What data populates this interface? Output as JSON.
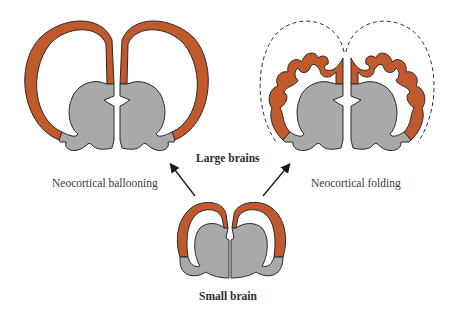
{
  "figure": {
    "labels": {
      "large_brains": "Large brains",
      "small_brain": "Small brain",
      "ballooning": "Neocortical ballooning",
      "folding": "Neocortical folding"
    },
    "nodes": [
      {
        "id": "small-brain",
        "label": "Small brain",
        "type": "coronal-section"
      },
      {
        "id": "large-brain-ballooned",
        "label": "Large brains",
        "type": "coronal-section",
        "cortex": "smooth, ballooned"
      },
      {
        "id": "large-brain-folded",
        "label": "Large brains",
        "type": "coronal-section",
        "cortex": "folded (gyri/sulci) within dashed outline"
      }
    ],
    "edges": [
      {
        "from": "small-brain",
        "to": "large-brain-ballooned",
        "label": "Neocortical ballooning"
      },
      {
        "from": "small-brain",
        "to": "large-brain-folded",
        "label": "Neocortical folding"
      }
    ],
    "colors": {
      "cortex": "#c0592b",
      "subcortex": "#a9a9a9",
      "outline": "#2a2a2a",
      "arrow": "#1a1a1a",
      "dashed_outline": "#333333",
      "background": "#ffffff"
    }
  }
}
